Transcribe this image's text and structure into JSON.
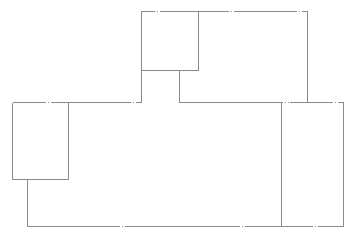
{
  "diagram": {
    "type": "floor-plan",
    "line_color": "#8a8a8a",
    "background": "#ffffff",
    "rooms": [
      {
        "id": "room-top-left-small"
      },
      {
        "id": "room-top-right"
      },
      {
        "id": "corridor-connector"
      },
      {
        "id": "room-left-small"
      },
      {
        "id": "main-hall"
      },
      {
        "id": "room-right-tall"
      }
    ]
  }
}
